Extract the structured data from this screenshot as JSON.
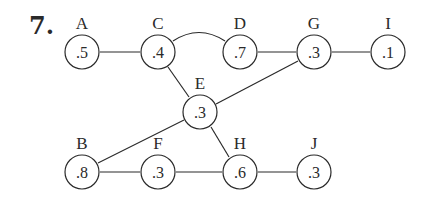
{
  "problem": {
    "number": "7."
  },
  "colors": {
    "ink": "#2a2a2a",
    "background": "#ffffff"
  },
  "nodes": {
    "A": {
      "label": "A",
      "value": ".5",
      "x": 82,
      "y": 52
    },
    "C": {
      "label": "C",
      "value": ".4",
      "x": 158,
      "y": 52
    },
    "D": {
      "label": "D",
      "value": ".7",
      "x": 240,
      "y": 52
    },
    "G": {
      "label": "G",
      "value": ".3",
      "x": 314,
      "y": 52
    },
    "I": {
      "label": "I",
      "value": ".1",
      "x": 388,
      "y": 52
    },
    "E": {
      "label": "E",
      "value": ".3",
      "x": 200,
      "y": 112
    },
    "B": {
      "label": "B",
      "value": ".8",
      "x": 82,
      "y": 172
    },
    "F": {
      "label": "F",
      "value": ".3",
      "x": 158,
      "y": 172
    },
    "H": {
      "label": "H",
      "value": ".6",
      "x": 240,
      "y": 172
    },
    "J": {
      "label": "J",
      "value": ".3",
      "x": 314,
      "y": 172
    }
  },
  "edges": [
    {
      "from": "A",
      "to": "C",
      "style": "straight"
    },
    {
      "from": "C",
      "to": "D",
      "style": "arc"
    },
    {
      "from": "D",
      "to": "G",
      "style": "straight"
    },
    {
      "from": "G",
      "to": "I",
      "style": "straight"
    },
    {
      "from": "C",
      "to": "E",
      "style": "straight"
    },
    {
      "from": "E",
      "to": "H",
      "style": "straight"
    },
    {
      "from": "G",
      "to": "E",
      "style": "straight"
    },
    {
      "from": "E",
      "to": "B",
      "style": "straight"
    },
    {
      "from": "B",
      "to": "F",
      "style": "straight"
    },
    {
      "from": "F",
      "to": "H",
      "style": "straight"
    },
    {
      "from": "H",
      "to": "J",
      "style": "straight"
    }
  ]
}
